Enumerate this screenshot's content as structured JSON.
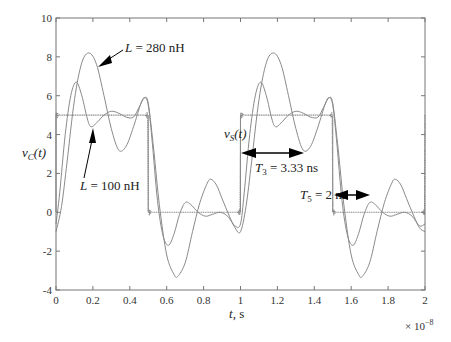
{
  "chart_data": {
    "type": "line",
    "title": "",
    "xlabel": "t, s",
    "ylabel": "v_C(t)",
    "x_multiplier": "× 10^-8",
    "xlim": [
      0,
      2
    ],
    "ylim": [
      -4,
      10
    ],
    "grid": false,
    "x_ticks": [
      "0",
      "0.2",
      "0.4",
      "0.6",
      "0.8",
      "1",
      "1.2",
      "1.4",
      "1.6",
      "1.8",
      "2"
    ],
    "y_ticks": [
      "-4",
      "-2",
      "0",
      "2",
      "4",
      "6",
      "8",
      "10"
    ],
    "series": [
      {
        "name": "L = 280 nH",
        "period": 1,
        "points": [
          [
            0,
            -1.0
          ],
          [
            0.03,
            0.3
          ],
          [
            0.06,
            2.6
          ],
          [
            0.1,
            5.8
          ],
          [
            0.14,
            7.7
          ],
          [
            0.18,
            8.2
          ],
          [
            0.22,
            7.6
          ],
          [
            0.26,
            6.0
          ],
          [
            0.3,
            4.3
          ],
          [
            0.34,
            3.2
          ],
          [
            0.38,
            3.4
          ],
          [
            0.42,
            4.4
          ],
          [
            0.46,
            5.6
          ],
          [
            0.48,
            5.9
          ],
          [
            0.5,
            5.6
          ],
          [
            0.53,
            3.2
          ],
          [
            0.56,
            0.4
          ],
          [
            0.6,
            -2.2
          ],
          [
            0.64,
            -3.2
          ],
          [
            0.66,
            -3.3
          ],
          [
            0.7,
            -2.6
          ],
          [
            0.74,
            -1.0
          ],
          [
            0.78,
            0.5
          ],
          [
            0.82,
            1.5
          ],
          [
            0.84,
            1.7
          ],
          [
            0.87,
            1.4
          ],
          [
            0.9,
            0.7
          ],
          [
            0.94,
            -0.2
          ],
          [
            0.97,
            -0.8
          ],
          [
            1.0,
            -1.0
          ]
        ]
      },
      {
        "name": "L = 100 nH",
        "period": 1,
        "points": [
          [
            0,
            -0.6
          ],
          [
            0.02,
            1.0
          ],
          [
            0.05,
            4.0
          ],
          [
            0.08,
            6.0
          ],
          [
            0.11,
            6.7
          ],
          [
            0.14,
            6.0
          ],
          [
            0.17,
            4.8
          ],
          [
            0.19,
            4.4
          ],
          [
            0.22,
            4.6
          ],
          [
            0.26,
            5.0
          ],
          [
            0.3,
            5.2
          ],
          [
            0.34,
            5.1
          ],
          [
            0.38,
            4.9
          ],
          [
            0.42,
            4.9
          ],
          [
            0.45,
            5.4
          ],
          [
            0.48,
            5.9
          ],
          [
            0.5,
            5.5
          ],
          [
            0.52,
            3.8
          ],
          [
            0.55,
            0.6
          ],
          [
            0.58,
            -1.2
          ],
          [
            0.61,
            -1.7
          ],
          [
            0.64,
            -1.1
          ],
          [
            0.67,
            -0.1
          ],
          [
            0.7,
            0.5
          ],
          [
            0.73,
            0.4
          ],
          [
            0.77,
            0.0
          ],
          [
            0.81,
            -0.2
          ],
          [
            0.85,
            -0.1
          ],
          [
            0.89,
            0.0
          ],
          [
            0.93,
            -0.2
          ],
          [
            0.97,
            -0.7
          ],
          [
            1.0,
            -0.6
          ]
        ]
      },
      {
        "name": "v_S(t)",
        "type": "square",
        "period": 1,
        "high": 5,
        "low": 0,
        "duty": 0.5
      }
    ],
    "annotations": [
      {
        "text": "L = 280 nH",
        "arrow_to": [
          0.2,
          7.5
        ]
      },
      {
        "text": "L = 100 nH",
        "arrow_to": [
          0.19,
          4.4
        ]
      },
      {
        "text": "v_S(t)",
        "at": [
          0.88,
          3.3
        ]
      },
      {
        "text": "T_3 = 3.33 ns",
        "double_arrow": [
          1.0,
          1.333,
          2.6
        ]
      },
      {
        "text": "T_5 = 2 ns",
        "double_arrow": [
          1.5,
          1.7,
          0.8
        ]
      }
    ]
  },
  "labels": {
    "ylabel_main": "v",
    "ylabel_sub": "C",
    "ylabel_tail": "(t)",
    "xlabel_var": "t",
    "xlabel_tail": ", s",
    "multiplier_base": "× 10",
    "multiplier_exp": "−8",
    "ann_280_L": "L",
    "ann_280_rest": " = 280 nH",
    "ann_100_L": "L",
    "ann_100_rest": " = 100 nH",
    "ann_vs_main": "v",
    "ann_vs_sub": "S",
    "ann_vs_tail": "(t)",
    "ann_t3_T": "T",
    "ann_t3_sub": "3",
    "ann_t3_rest": " = 3.33 ns",
    "ann_t5_T": "T",
    "ann_t5_sub": "5",
    "ann_t5_rest": " = 2 ns"
  },
  "colors": {
    "curve": "#8a8a8a",
    "axis": "#555555",
    "text": "#222222",
    "arrow": "#000000"
  }
}
